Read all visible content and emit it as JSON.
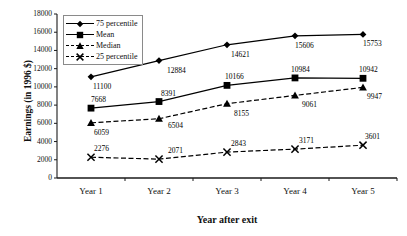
{
  "chart_data": {
    "type": "line",
    "title": "",
    "xlabel": "Year after exit",
    "ylabel": "Earnings (in 1996 $)",
    "categories": [
      "Year 1",
      "Year 2",
      "Year 3",
      "Year 4",
      "Year 5"
    ],
    "ylim": [
      0,
      18000
    ],
    "ytick_step": 2000,
    "yticks": [
      18000,
      16000,
      14000,
      12000,
      10000,
      8000,
      6000,
      4000,
      2000,
      0
    ],
    "ytick_labels": [
      "18000",
      "16000",
      "14000",
      "12000",
      "10000",
      "8000",
      "6000",
      "4000",
      "2000",
      "0"
    ],
    "grid": false,
    "legend_position": "top-left-inside",
    "series": [
      {
        "name": "75 percentile",
        "marker": "diamond",
        "line_style": "solid",
        "color": "#000000",
        "values": [
          11100,
          12884,
          14621,
          15606,
          15753
        ],
        "value_labels": [
          "11100",
          "12884",
          "14621",
          "15606",
          "15753"
        ]
      },
      {
        "name": "Mean",
        "marker": "square",
        "line_style": "solid",
        "color": "#000000",
        "values": [
          7668,
          8391,
          10166,
          10984,
          10942
        ],
        "value_labels": [
          "7668",
          "8391",
          "10166",
          "10984",
          "10942"
        ]
      },
      {
        "name": "Median",
        "marker": "triangle",
        "line_style": "dashed",
        "color": "#000000",
        "values": [
          6059,
          6504,
          8155,
          9061,
          9947
        ],
        "value_labels": [
          "6059",
          "6504",
          "8155",
          "9061",
          "9947"
        ]
      },
      {
        "name": "25 percentile",
        "marker": "x",
        "line_style": "dashed",
        "color": "#000000",
        "values": [
          2276,
          2071,
          2843,
          3171,
          3601
        ],
        "value_labels": [
          "2276",
          "2071",
          "2843",
          "3171",
          "3601"
        ]
      }
    ]
  }
}
